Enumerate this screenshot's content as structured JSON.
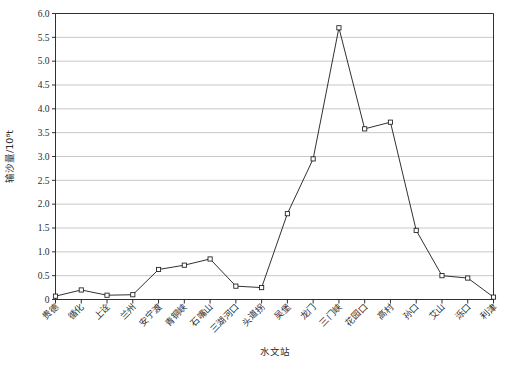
{
  "chart_data": {
    "type": "line",
    "title": "",
    "xlabel": "水文站",
    "ylabel": "输沙量/10⁸t",
    "ylim": [
      0,
      6.0
    ],
    "ytick_step": 0.5,
    "grid": "horizontal",
    "legend": "none",
    "marker": "open-square",
    "line_color": "#1a1a1a",
    "grid_color": "#b0b0b0",
    "axis_color": "#1a1a1a",
    "ytick_labels": [
      "0",
      "0.5",
      "1.0",
      "1.5",
      "2.0",
      "2.5",
      "3.0",
      "3.5",
      "4.0",
      "4.5",
      "5.0",
      "5.5",
      "6.0"
    ],
    "ytick_values": [
      0,
      0.5,
      1.0,
      1.5,
      2.0,
      2.5,
      3.0,
      3.5,
      4.0,
      4.5,
      5.0,
      5.5,
      6.0
    ],
    "categories": [
      "贵德",
      "循化",
      "上诠",
      "兰州",
      "安宁渡",
      "青铜峡",
      "石嘴山",
      "三湖河口",
      "头道拐",
      "吴堡",
      "龙门",
      "三门峡",
      "花园口",
      "高村",
      "孙口",
      "艾山",
      "泺口",
      "利津"
    ],
    "values": [
      0.07,
      0.2,
      0.09,
      0.1,
      0.63,
      0.72,
      0.85,
      0.28,
      0.25,
      1.8,
      2.95,
      5.7,
      3.58,
      3.72,
      1.45,
      0.5,
      0.45,
      0.05
    ]
  }
}
